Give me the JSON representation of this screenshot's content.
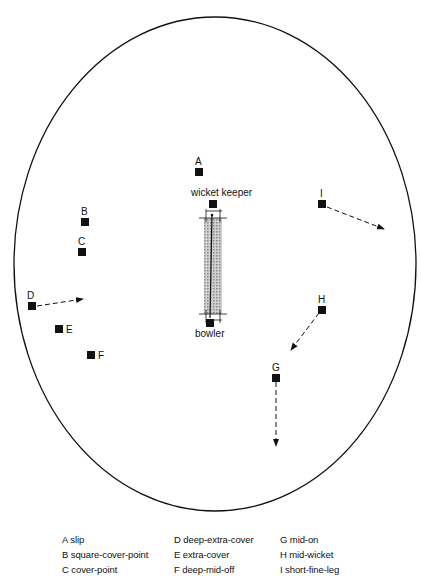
{
  "diagram": {
    "title": "",
    "field": {
      "shape": "oval",
      "cx": 215,
      "cy": 264,
      "rx": 201,
      "ry": 247,
      "stroke": "#111111"
    },
    "pitch": {
      "x": 204,
      "y": 213,
      "width": 18,
      "height": 105,
      "fill": "#bdbdbd",
      "label_top": "wicket keeper",
      "label_bottom": "bowler"
    },
    "fielders": [
      {
        "id": "A",
        "x": 199,
        "y": 172,
        "label_x": 195,
        "label_y": 165
      },
      {
        "id": "B",
        "x": 85,
        "y": 222,
        "label_x": 81,
        "label_y": 215
      },
      {
        "id": "C",
        "x": 82,
        "y": 252,
        "label_x": 78,
        "label_y": 245
      },
      {
        "id": "D",
        "x": 32,
        "y": 306,
        "label_x": 27,
        "label_y": 299
      },
      {
        "id": "E",
        "x": 59,
        "y": 329,
        "label_x": 66,
        "label_y": 333
      },
      {
        "id": "F",
        "x": 91,
        "y": 355,
        "label_x": 98,
        "label_y": 359
      },
      {
        "id": "G",
        "x": 276,
        "y": 378,
        "label_x": 272,
        "label_y": 371
      },
      {
        "id": "H",
        "x": 322,
        "y": 310,
        "label_x": 318,
        "label_y": 303
      },
      {
        "id": "I",
        "x": 322,
        "y": 204,
        "label_x": 320,
        "label_y": 197
      }
    ],
    "keeper_marker": {
      "x": 213,
      "y": 204
    },
    "bowler_marker": {
      "x": 210,
      "y": 323
    },
    "movement_arrows": [
      {
        "from": "D",
        "x1": 37,
        "y1": 306,
        "x2": 83,
        "y2": 299
      },
      {
        "from": "G",
        "x1": 276,
        "y1": 382,
        "x2": 276,
        "y2": 446
      },
      {
        "from": "H",
        "x1": 319,
        "y1": 313,
        "x2": 291,
        "y2": 350
      },
      {
        "from": "I",
        "x1": 327,
        "y1": 207,
        "x2": 384,
        "y2": 229
      }
    ],
    "legend": [
      {
        "key": "A",
        "text": "A slip"
      },
      {
        "key": "D",
        "text": "D deep-extra-cover"
      },
      {
        "key": "G",
        "text": "G mid-on"
      },
      {
        "key": "B",
        "text": "B square-cover-point"
      },
      {
        "key": "E",
        "text": "E extra-cover"
      },
      {
        "key": "H",
        "text": "H mid-wicket"
      },
      {
        "key": "C",
        "text": "C cover-point"
      },
      {
        "key": "F",
        "text": "F deep-mid-off"
      },
      {
        "key": "I",
        "text": "I short-fine-leg"
      }
    ]
  }
}
